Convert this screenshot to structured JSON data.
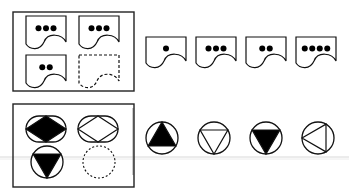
{
  "puzzles": [
    {
      "name": "puzzle-1",
      "kind": "dot-pages",
      "grid": [
        {
          "dots": 3,
          "style": "solid"
        },
        {
          "dots": 3,
          "style": "solid"
        },
        {
          "dots": 2,
          "style": "solid"
        },
        {
          "dots": 0,
          "style": "dashed",
          "missing": true
        }
      ],
      "options": [
        {
          "dots": 1
        },
        {
          "dots": 3
        },
        {
          "dots": 2
        },
        {
          "dots": 4
        }
      ]
    },
    {
      "name": "puzzle-2",
      "kind": "circle-shapes",
      "grid": [
        {
          "shape": "oval-diamond",
          "fill": "black"
        },
        {
          "shape": "oval-diamond",
          "fill": "white"
        },
        {
          "shape": "circle-triangle-down",
          "fill": "black"
        },
        {
          "shape": "empty",
          "style": "dashed",
          "missing": true
        }
      ],
      "options": [
        {
          "shape": "circle-triangle-up",
          "fill": "black"
        },
        {
          "shape": "circle-triangle-down",
          "fill": "white"
        },
        {
          "shape": "circle-triangle-down",
          "fill": "black"
        },
        {
          "shape": "circle-triangle-left",
          "fill": "white"
        }
      ]
    }
  ]
}
